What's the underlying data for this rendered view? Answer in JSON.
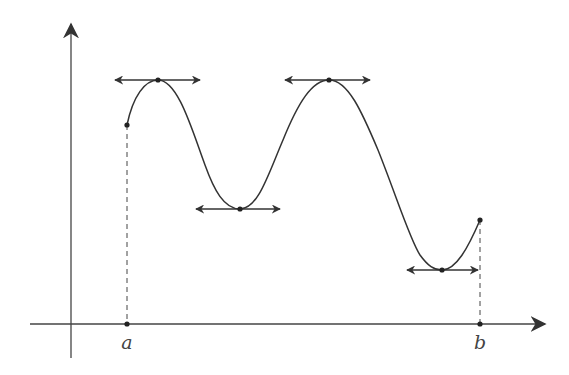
{
  "diagram": {
    "colors": {
      "curve": "#333333",
      "axis": "#444444",
      "background": "#ffffff"
    },
    "axes": {
      "x_axis": {
        "y": 324,
        "x_start": 30,
        "x_end": 545
      },
      "y_axis": {
        "x": 71,
        "y_start": 358,
        "y_end": 24
      }
    },
    "labels": {
      "a": "a",
      "b": "b"
    },
    "interval": {
      "a": {
        "x": 127,
        "y_axis": 324,
        "y_curve": 125
      },
      "b": {
        "x": 480,
        "y_axis": 324,
        "y_curve": 220
      }
    },
    "extrema": [
      {
        "type": "local-max",
        "x": 158,
        "y": 80,
        "tangent_x1": 115,
        "tangent_x2": 200
      },
      {
        "type": "local-min",
        "x": 240,
        "y": 209,
        "tangent_x1": 196,
        "tangent_x2": 280
      },
      {
        "type": "local-max",
        "x": 329,
        "y": 80,
        "tangent_x1": 285,
        "tangent_x2": 370
      },
      {
        "type": "local-min",
        "x": 442,
        "y": 270,
        "tangent_x1": 407,
        "tangent_x2": 478
      }
    ]
  }
}
